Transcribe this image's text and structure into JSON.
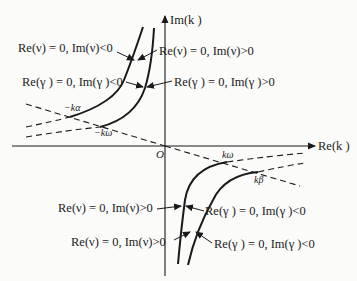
{
  "axes": {
    "x_label": "Re(k )",
    "y_label": "Im(k )",
    "origin_label": "O"
  },
  "points": {
    "neg_k_alpha": "−kα",
    "neg_k_omega": "−kω",
    "k_omega": "kω",
    "k_beta": "kβ"
  },
  "annotations": {
    "upper_left_nu": "Re(ν) = 0, Im(ν)<0",
    "upper_right_nu": "Re(ν) = 0, Im(ν)>0",
    "upper_left_gamma": "Re(γ ) = 0, Im(γ )<0",
    "upper_right_gamma": "Re(γ ) = 0, Im(γ )>0",
    "lower_left_nu_1": "Re(ν) = 0, Im(ν)>0",
    "lower_left_nu_2": "Re(ν) = 0, Im(ν)>0",
    "lower_right_gamma_1": "Re(γ ) = 0, Im(γ )<0",
    "lower_right_gamma_2": "Re(γ ) = 0, Im(γ )<0"
  },
  "colors": {
    "ink": "#1a1a1a",
    "background": "#fbfbfa"
  }
}
